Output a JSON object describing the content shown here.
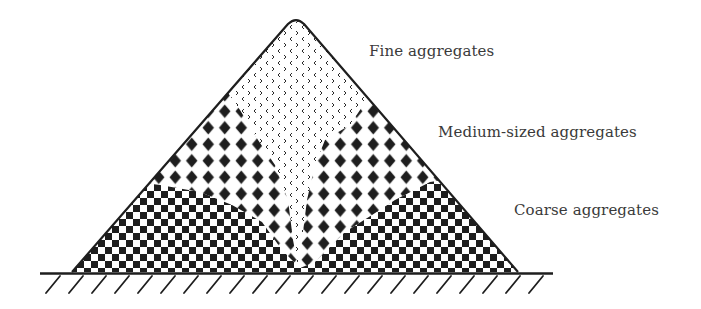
{
  "diagram": {
    "type": "aggregate-segregation-stockpile",
    "labels": {
      "fine": "Fine aggregates",
      "medium": "Medium-sized aggregates",
      "coarse": "Coarse aggregates"
    },
    "colors": {
      "ink": "#1e1e1e",
      "text": "#3a3a3a",
      "background": "#ffffff"
    },
    "zones": [
      {
        "name": "fine",
        "pattern": "chevron-dots",
        "position": "central core from apex"
      },
      {
        "name": "medium",
        "pattern": "black-diamonds",
        "position": "middle flanks"
      },
      {
        "name": "coarse",
        "pattern": "checkerboard",
        "position": "base and outer toes"
      }
    ],
    "ground": {
      "style": "hatched-line"
    }
  }
}
